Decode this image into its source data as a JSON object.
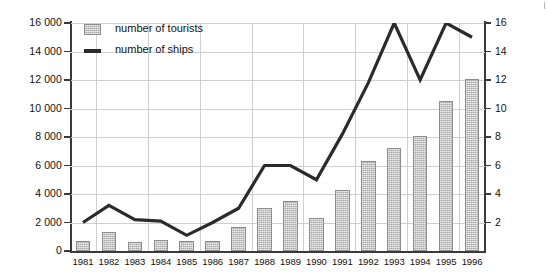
{
  "artifact_text": "",
  "legend": {
    "position": "inside-top-left",
    "items": [
      {
        "label": "number of tourists",
        "swatch": "hatched-bar-swatch"
      },
      {
        "label": "number of ships",
        "swatch": "thick-line-swatch"
      }
    ]
  },
  "axes": {
    "left_ticks": [
      "0",
      "2 000",
      "4 000",
      "6 000",
      "8 000",
      "10 000",
      "12 000",
      "14 000",
      "16 000"
    ],
    "right_ticks": [
      "2",
      "4",
      "6",
      "8",
      "10",
      "12",
      "14",
      "16"
    ],
    "x_ticks": [
      "1981",
      "1982",
      "1983",
      "1984",
      "1985",
      "1986",
      "1987",
      "1988",
      "1989",
      "1990",
      "1991",
      "1992",
      "1993",
      "1994",
      "1995",
      "1996"
    ]
  },
  "colors": {
    "bar_fill": "#a9a9a9",
    "bar_border": "#8d8d8d",
    "line": "#2b2b2b",
    "grid": "#cfcfcf",
    "axis": "#3a3a3a",
    "background": "#ffffff"
  },
  "chart_data": {
    "type": "bar",
    "title": "",
    "subtitle": "",
    "xlabel": "",
    "ylabel": "",
    "y2label": "",
    "grid": true,
    "legend_position": "inside-top-left",
    "categories": [
      "1981",
      "1982",
      "1983",
      "1984",
      "1985",
      "1986",
      "1987",
      "1988",
      "1989",
      "1990",
      "1991",
      "1992",
      "1993",
      "1994",
      "1995",
      "1996"
    ],
    "ylim": [
      0,
      16000
    ],
    "ytick_step": 2000,
    "y2lim": [
      0,
      16
    ],
    "y2tick_step": 2,
    "series": [
      {
        "name": "number of tourists",
        "type": "bar",
        "axis": "left",
        "values": [
          700,
          1300,
          600,
          800,
          700,
          700,
          1700,
          3000,
          3500,
          2300,
          4300,
          6300,
          7200,
          8100,
          10500,
          12100
        ]
      },
      {
        "name": "number of ships",
        "type": "line",
        "axis": "right",
        "values": [
          2.0,
          3.2,
          2.2,
          2.1,
          1.1,
          2.0,
          3.0,
          6.0,
          6.0,
          5.0,
          8.2,
          11.8,
          16.0,
          12.0,
          16.0,
          15.0
        ]
      }
    ]
  }
}
